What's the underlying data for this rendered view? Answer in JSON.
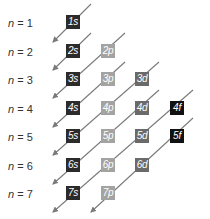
{
  "diagram": {
    "type": "aufbau-orbital-filling-order",
    "shells": [
      {
        "n": "1",
        "label_prefix": "n",
        "label_eq": " = ",
        "orbitals": [
          "1s"
        ]
      },
      {
        "n": "2",
        "label_prefix": "n",
        "label_eq": " = ",
        "orbitals": [
          "2s",
          "2p"
        ]
      },
      {
        "n": "3",
        "label_prefix": "n",
        "label_eq": " = ",
        "orbitals": [
          "3s",
          "3p",
          "3d"
        ]
      },
      {
        "n": "4",
        "label_prefix": "n",
        "label_eq": " = ",
        "orbitals": [
          "4s",
          "4p",
          "4d",
          "4f"
        ]
      },
      {
        "n": "5",
        "label_prefix": "n",
        "label_eq": " = ",
        "orbitals": [
          "5s",
          "5p",
          "5d",
          "5f"
        ]
      },
      {
        "n": "6",
        "label_prefix": "n",
        "label_eq": " = ",
        "orbitals": [
          "6s",
          "6p",
          "6d"
        ]
      },
      {
        "n": "7",
        "label_prefix": "n",
        "label_eq": " = ",
        "orbitals": [
          "7s",
          "7p"
        ]
      }
    ],
    "subshell_colors": {
      "s": "#2b2b2b",
      "p": "#a3a3a3",
      "d": "#6a6a6a",
      "f": "#111111"
    },
    "arrow_color": "#7a7a7a",
    "filling_order": [
      "1s",
      "2s",
      "2p",
      "3s",
      "3p",
      "4s",
      "3d",
      "4p",
      "5s",
      "4d",
      "5p",
      "6s",
      "4f",
      "5d",
      "6p",
      "7s",
      "5f",
      "6d",
      "7p"
    ]
  }
}
